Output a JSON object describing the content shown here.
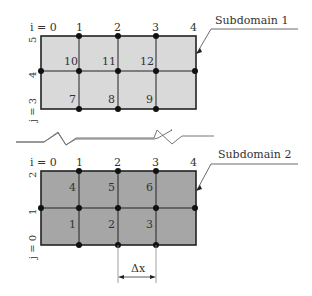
{
  "subdomain1": {
    "label": "Subdomain 1",
    "fill": "#d9d9d9",
    "i_labels": [
      "i = 0",
      "1",
      "2",
      "3",
      "4"
    ],
    "j_labels": [
      "5",
      "4",
      "j = 3"
    ],
    "cells": [
      "10",
      "11",
      "12",
      "7",
      "8",
      "9"
    ]
  },
  "subdomain2": {
    "label": "Subdomain 2",
    "fill": "#a6a6a6",
    "i_labels": [
      "i = 0",
      "1",
      "2",
      "3",
      "4"
    ],
    "j_labels": [
      "2",
      "1",
      "j = 0"
    ],
    "cells": [
      "4",
      "5",
      "6",
      "1",
      "2",
      "3"
    ]
  },
  "dimension": {
    "label": "Δx"
  }
}
